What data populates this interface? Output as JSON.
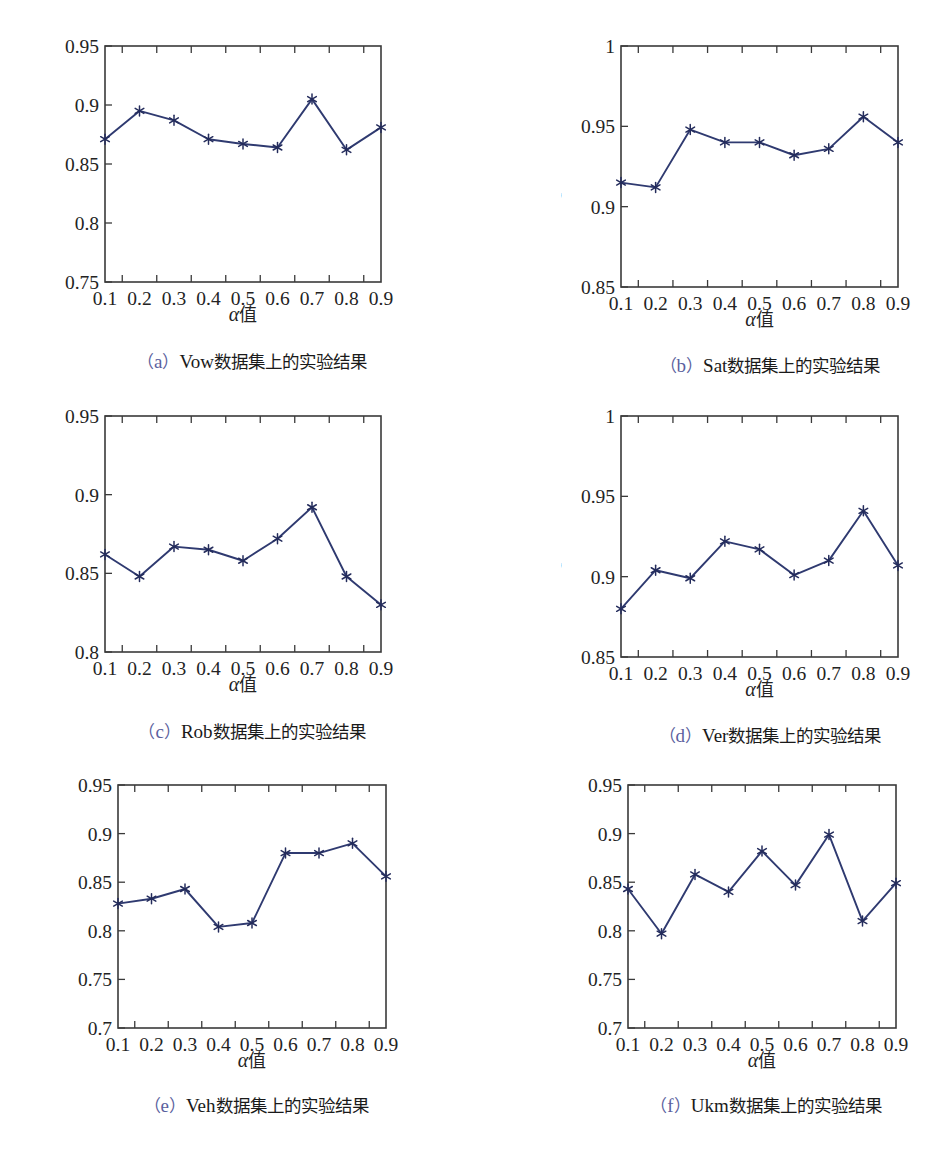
{
  "figure": {
    "xlabel_alpha": "α",
    "xlabel_cjk": "值",
    "ylabel_main": "F",
    "ylabel_sub": "1",
    "ylabel_rest": "-measure",
    "paren_open": "（",
    "paren_close": "）",
    "x_tick_labels": [
      "0.1",
      "0.2",
      "0.3",
      "0.4",
      "0.5",
      "0.6",
      "0.7",
      "0.8",
      "0.9"
    ],
    "line_color": "#2f3a70",
    "marker_color": "#242c5c",
    "axis_color": "#3a3a3a",
    "caption_index_color": "#5b5f9e"
  },
  "chart_data": [
    {
      "type": "line",
      "panel_index": "a",
      "dataset": "Vow",
      "caption_cjk": "数据集上的实验结果",
      "title": "",
      "xlabel": "α值",
      "ylabel": "F1-measure",
      "categories": [
        "0.1",
        "0.2",
        "0.3",
        "0.4",
        "0.5",
        "0.6",
        "0.7",
        "0.8",
        "0.9"
      ],
      "x": [
        0.1,
        0.2,
        0.3,
        0.4,
        0.5,
        0.6,
        0.7,
        0.8,
        0.9
      ],
      "values": [
        0.871,
        0.895,
        0.887,
        0.871,
        0.867,
        0.864,
        0.905,
        0.862,
        0.881
      ],
      "ylim": [
        0.75,
        0.95
      ],
      "yticks": [
        0.75,
        0.8,
        0.85,
        0.9,
        0.95
      ],
      "ytick_labels": [
        "0.75",
        "0.8",
        "0.85",
        "0.9",
        "0.95"
      ],
      "grid": false,
      "legend": "none"
    },
    {
      "type": "line",
      "panel_index": "b",
      "dataset": "Sat",
      "caption_cjk": "数据集上的实验结果",
      "title": "",
      "xlabel": "α值",
      "ylabel": "F1-measure",
      "categories": [
        "0.1",
        "0.2",
        "0.3",
        "0.4",
        "0.5",
        "0.6",
        "0.7",
        "0.8",
        "0.9"
      ],
      "x": [
        0.1,
        0.2,
        0.3,
        0.4,
        0.5,
        0.6,
        0.7,
        0.8,
        0.9
      ],
      "values": [
        0.915,
        0.912,
        0.948,
        0.94,
        0.94,
        0.932,
        0.936,
        0.956,
        0.94
      ],
      "ylim": [
        0.85,
        1.0
      ],
      "yticks": [
        0.85,
        0.9,
        0.95,
        1.0
      ],
      "ytick_labels": [
        "0.85",
        "0.9",
        "0.95",
        "1"
      ],
      "grid": false,
      "legend": "none"
    },
    {
      "type": "line",
      "panel_index": "c",
      "dataset": "Rob",
      "caption_cjk": "数据集上的实验结果",
      "title": "",
      "xlabel": "α值",
      "ylabel": "F1-measure",
      "categories": [
        "0.1",
        "0.2",
        "0.3",
        "0.4",
        "0.5",
        "0.6",
        "0.7",
        "0.8",
        "0.9"
      ],
      "x": [
        0.1,
        0.2,
        0.3,
        0.4,
        0.5,
        0.6,
        0.7,
        0.8,
        0.9
      ],
      "values": [
        0.862,
        0.848,
        0.867,
        0.865,
        0.858,
        0.872,
        0.892,
        0.848,
        0.83
      ],
      "ylim": [
        0.8,
        0.95
      ],
      "yticks": [
        0.8,
        0.85,
        0.9,
        0.95
      ],
      "ytick_labels": [
        "0.8",
        "0.85",
        "0.9",
        "0.95"
      ],
      "grid": false,
      "legend": "none"
    },
    {
      "type": "line",
      "panel_index": "d",
      "dataset": "Ver",
      "caption_cjk": "数据集上的实验结果",
      "title": "",
      "xlabel": "α值",
      "ylabel": "F1-measure",
      "categories": [
        "0.1",
        "0.2",
        "0.3",
        "0.4",
        "0.5",
        "0.6",
        "0.7",
        "0.8",
        "0.9"
      ],
      "x": [
        0.1,
        0.2,
        0.3,
        0.4,
        0.5,
        0.6,
        0.7,
        0.8,
        0.9
      ],
      "values": [
        0.88,
        0.904,
        0.899,
        0.922,
        0.917,
        0.901,
        0.91,
        0.941,
        0.907
      ],
      "ylim": [
        0.85,
        1.0
      ],
      "yticks": [
        0.85,
        0.9,
        0.95,
        1.0
      ],
      "ytick_labels": [
        "0.85",
        "0.9",
        "0.95",
        "1"
      ],
      "grid": false,
      "legend": "none"
    },
    {
      "type": "line",
      "panel_index": "e",
      "dataset": "Veh",
      "caption_cjk": "数据集上的实验结果",
      "title": "",
      "xlabel": "α值",
      "ylabel": "F1-measure",
      "categories": [
        "0.1",
        "0.2",
        "0.3",
        "0.4",
        "0.5",
        "0.6",
        "0.7",
        "0.8",
        "0.9"
      ],
      "x": [
        0.1,
        0.2,
        0.3,
        0.4,
        0.5,
        0.6,
        0.7,
        0.8,
        0.9
      ],
      "values": [
        0.828,
        0.833,
        0.843,
        0.804,
        0.808,
        0.88,
        0.88,
        0.89,
        0.856
      ],
      "ylim": [
        0.7,
        0.95
      ],
      "yticks": [
        0.7,
        0.75,
        0.8,
        0.85,
        0.9,
        0.95
      ],
      "ytick_labels": [
        "0.7",
        "0.75",
        "0.8",
        "0.85",
        "0.9",
        "0.95"
      ],
      "grid": false,
      "legend": "none"
    },
    {
      "type": "line",
      "panel_index": "f",
      "dataset": "Ukm",
      "caption_cjk": "数据集上的实验结果",
      "title": "",
      "xlabel": "α值",
      "ylabel": "F1-measure",
      "categories": [
        "0.1",
        "0.2",
        "0.3",
        "0.4",
        "0.5",
        "0.6",
        "0.7",
        "0.8",
        "0.9"
      ],
      "x": [
        0.1,
        0.2,
        0.3,
        0.4,
        0.5,
        0.6,
        0.7,
        0.8,
        0.9
      ],
      "values": [
        0.843,
        0.797,
        0.858,
        0.84,
        0.882,
        0.847,
        0.899,
        0.81,
        0.849
      ],
      "ylim": [
        0.7,
        0.95
      ],
      "yticks": [
        0.7,
        0.75,
        0.8,
        0.85,
        0.9,
        0.95
      ],
      "ytick_labels": [
        "0.7",
        "0.75",
        "0.8",
        "0.85",
        "0.9",
        "0.95"
      ],
      "grid": false,
      "legend": "none"
    }
  ]
}
